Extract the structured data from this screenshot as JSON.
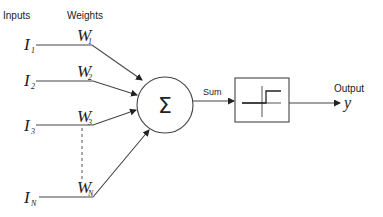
{
  "headers": {
    "inputs": "Inputs",
    "weights": "Weights"
  },
  "inputs": [
    {
      "symbol": "I",
      "sub": "1",
      "weight_symbol": "W",
      "weight_sub": "1"
    },
    {
      "symbol": "I",
      "sub": "2",
      "weight_symbol": "W",
      "weight_sub": "2"
    },
    {
      "symbol": "I",
      "sub": "3",
      "weight_symbol": "W",
      "weight_sub": "3"
    },
    {
      "symbol": "I",
      "sub": "N",
      "weight_symbol": "W",
      "weight_sub": "N"
    }
  ],
  "summation": {
    "symbol": "Σ",
    "edge_label": "Sum"
  },
  "activation": {
    "type": "step-function-icon"
  },
  "output": {
    "label": "Output",
    "symbol": "y"
  },
  "colors": {
    "stroke": "#444444",
    "text": "#222222",
    "background": "#ffffff"
  }
}
